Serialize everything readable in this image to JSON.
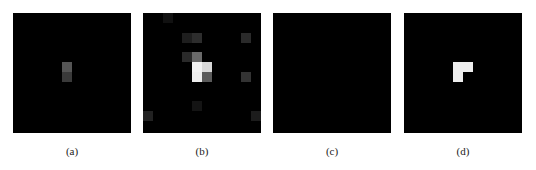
{
  "figure": {
    "grid_size": 12,
    "cell_px": 9.8,
    "panels": [
      {
        "id": "a",
        "caption": "(a)",
        "left": 13,
        "cells": [
          {
            "row": 5,
            "col": 5,
            "color": "#555555"
          },
          {
            "row": 6,
            "col": 5,
            "color": "#3a3a3a"
          }
        ]
      },
      {
        "id": "b",
        "caption": "(b)",
        "left": 143,
        "cells": [
          {
            "row": 0,
            "col": 2,
            "color": "#111111"
          },
          {
            "row": 2,
            "col": 4,
            "color": "#1e1e1e"
          },
          {
            "row": 2,
            "col": 5,
            "color": "#2d2d2d"
          },
          {
            "row": 2,
            "col": 10,
            "color": "#2a2a2a"
          },
          {
            "row": 4,
            "col": 4,
            "color": "#2a2a2a"
          },
          {
            "row": 4,
            "col": 5,
            "color": "#6a6a6a"
          },
          {
            "row": 5,
            "col": 5,
            "color": "#f2f2f2"
          },
          {
            "row": 5,
            "col": 6,
            "color": "#d8d8d8"
          },
          {
            "row": 6,
            "col": 5,
            "color": "#eeeeee"
          },
          {
            "row": 6,
            "col": 6,
            "color": "#5a5a5a"
          },
          {
            "row": 6,
            "col": 10,
            "color": "#333333"
          },
          {
            "row": 9,
            "col": 5,
            "color": "#141414"
          },
          {
            "row": 10,
            "col": 0,
            "color": "#222222"
          },
          {
            "row": 10,
            "col": 11,
            "color": "#1c1c1c"
          }
        ]
      },
      {
        "id": "c",
        "caption": "(c)",
        "left": 273,
        "cells": []
      },
      {
        "id": "d",
        "caption": "(d)",
        "left": 404,
        "cells": [
          {
            "row": 5,
            "col": 5,
            "color": "#eeeeee"
          },
          {
            "row": 5,
            "col": 6,
            "color": "#eeeeee"
          },
          {
            "row": 6,
            "col": 5,
            "color": "#eeeeee"
          }
        ]
      }
    ]
  }
}
